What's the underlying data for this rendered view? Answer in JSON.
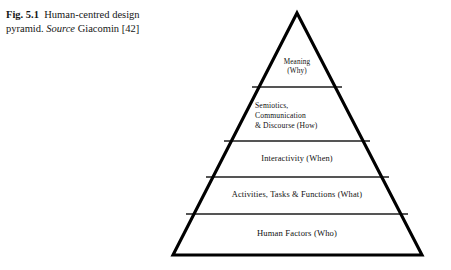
{
  "caption": {
    "figure_label": "Fig. 5.1",
    "description": "Human-centred design pyramid.",
    "source_word": "Source",
    "source_citation": "Giacomin [42]"
  },
  "diagram": {
    "title": "Human-centred design pyramid",
    "shape": "pyramid",
    "outline_color": "#000000",
    "divider_color": "#555555",
    "fill_color": "#ffffff",
    "apex": {
      "x": 297,
      "y": 13
    },
    "base_left": {
      "x": 173,
      "y": 255
    },
    "base_right": {
      "x": 422,
      "y": 255
    },
    "divider_y": [
      87,
      141,
      177,
      214
    ],
    "tiers": [
      {
        "index": 1,
        "position": "top",
        "text": "Meaning\n(Why)",
        "align": "center"
      },
      {
        "index": 2,
        "position": "upper-middle",
        "text": "Semiotics,\nCommunication\n& Discourse (How)",
        "align": "left"
      },
      {
        "index": 3,
        "position": "middle",
        "text": "Interactivity (When)",
        "align": "center"
      },
      {
        "index": 4,
        "position": "lower-middle",
        "text": "Activities, Tasks & Functions (What)",
        "align": "center"
      },
      {
        "index": 5,
        "position": "base",
        "text": "Human Factors (Who)",
        "align": "center"
      }
    ]
  }
}
